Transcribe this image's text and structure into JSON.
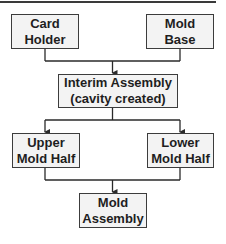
{
  "diagram": {
    "type": "flowchart",
    "colors": {
      "box_fill": "#f3f3f3",
      "box_border": "#3c3c3c",
      "line": "#2a2a2a",
      "text": "#1e1e1e"
    },
    "nodes": {
      "card_holder": {
        "line1": "Card",
        "line2": "Holder"
      },
      "mold_base": {
        "line1": "Mold",
        "line2": "Base"
      },
      "interim_assembly": {
        "line1": "Interim Assembly",
        "line2": "(cavity created)"
      },
      "upper_mold_half": {
        "line1": "Upper",
        "line2": "Mold Half"
      },
      "lower_mold_half": {
        "line1": "Lower",
        "line2": "Mold Half"
      },
      "mold_assembly": {
        "line1": "Mold",
        "line2": "Assembly"
      }
    },
    "edges": [
      {
        "from": "card_holder",
        "to": "interim_assembly"
      },
      {
        "from": "mold_base",
        "to": "interim_assembly"
      },
      {
        "from": "interim_assembly",
        "to": "upper_mold_half"
      },
      {
        "from": "interim_assembly",
        "to": "lower_mold_half"
      },
      {
        "from": "upper_mold_half",
        "to": "mold_assembly"
      },
      {
        "from": "lower_mold_half",
        "to": "mold_assembly"
      }
    ]
  }
}
